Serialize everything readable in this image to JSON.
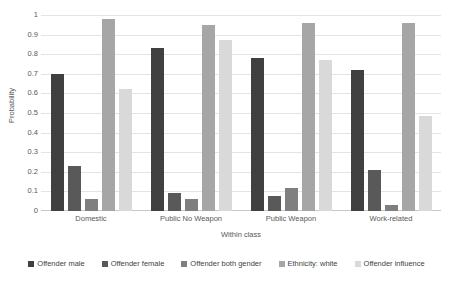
{
  "chart_data": {
    "type": "bar",
    "title": "",
    "xlabel": "Within class",
    "ylabel": "Probability",
    "ylim": [
      0,
      1
    ],
    "ytick_labels": [
      "1",
      "0.9",
      "0.8",
      "0.7",
      "0.6",
      "0.5",
      "0.4",
      "0.3",
      "0.2",
      "0.1",
      "0"
    ],
    "ytick_values": [
      1,
      0.9,
      0.8,
      0.7,
      0.6,
      0.5,
      0.4,
      0.3,
      0.2,
      0.1,
      0
    ],
    "grid": true,
    "legend_position": "bottom",
    "categories": [
      "Domestic",
      "Public No Weapon",
      "Public Weapon",
      "Work-related"
    ],
    "series": [
      {
        "name": "Offender male",
        "color": "#404040",
        "values": [
          0.7,
          0.83,
          0.78,
          0.72
        ]
      },
      {
        "name": "Offender female",
        "color": "#595959",
        "values": [
          0.23,
          0.09,
          0.075,
          0.21
        ]
      },
      {
        "name": "Offender both gender",
        "color": "#7f7f7f",
        "values": [
          0.06,
          0.06,
          0.115,
          0.03
        ]
      },
      {
        "name": "Ethnicity: white",
        "color": "#a6a6a6",
        "values": [
          0.98,
          0.95,
          0.96,
          0.96
        ]
      },
      {
        "name": "Offender influence",
        "color": "#d9d9d9",
        "values": [
          0.62,
          0.87,
          0.77,
          0.485
        ]
      }
    ]
  }
}
